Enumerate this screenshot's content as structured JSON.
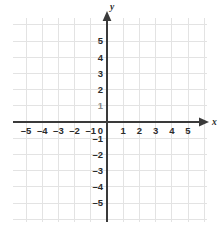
{
  "chart_data": {
    "type": "scatter",
    "title": "",
    "subtitle": "",
    "xlabel": "x",
    "ylabel": "y",
    "xlim": [
      -6,
      6
    ],
    "ylim": [
      -6,
      6
    ],
    "grid": true,
    "grid_step": 1,
    "legend": null,
    "series": [],
    "x": [],
    "values": [],
    "annotations": [],
    "origin_label": "0",
    "x_tick_labels": [
      "–5",
      "–4",
      "–3",
      "–2",
      "–1",
      "1",
      "2",
      "3",
      "4",
      "5"
    ],
    "x_tick_values": [
      -5,
      -4,
      -3,
      -2,
      -1,
      1,
      2,
      3,
      4,
      5
    ],
    "y_tick_labels": [
      "5",
      "4",
      "3",
      "2",
      "1",
      "–1",
      "–2",
      "–3",
      "–4",
      "–5"
    ],
    "y_tick_values": [
      5,
      4,
      3,
      2,
      1,
      -1,
      -2,
      -3,
      -4,
      -5
    ],
    "colors": {
      "grid": "#e3e3e3",
      "axis": "#3a3a3a",
      "label": "#2b2b2b",
      "background": "#ffffff"
    }
  },
  "axes": {
    "x_name": "x",
    "y_name": "y"
  },
  "ticks": {
    "x": [
      {
        "label": "–5",
        "value": -5
      },
      {
        "label": "–4",
        "value": -4
      },
      {
        "label": "–3",
        "value": -3
      },
      {
        "label": "–2",
        "value": -2
      },
      {
        "label": "–1",
        "value": -1
      },
      {
        "label": "1",
        "value": 1
      },
      {
        "label": "2",
        "value": 2
      },
      {
        "label": "3",
        "value": 3
      },
      {
        "label": "4",
        "value": 4
      },
      {
        "label": "5",
        "value": 5
      }
    ],
    "y": [
      {
        "label": "5",
        "value": 5
      },
      {
        "label": "4",
        "value": 4
      },
      {
        "label": "3",
        "value": 3
      },
      {
        "label": "2",
        "value": 2
      },
      {
        "label": "1",
        "value": 1
      },
      {
        "label": "–1",
        "value": -1
      },
      {
        "label": "–2",
        "value": -2
      },
      {
        "label": "–3",
        "value": -3
      },
      {
        "label": "–4",
        "value": -4
      },
      {
        "label": "–5",
        "value": -5
      }
    ],
    "origin": "0"
  }
}
